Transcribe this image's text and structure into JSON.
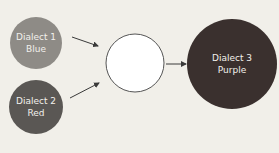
{
  "diagram": {
    "nodes": [
      {
        "id": "dialect1",
        "line1": "Dialect 1",
        "line2": "Blue",
        "fill": "#8e8b86"
      },
      {
        "id": "dialect2",
        "line1": "Dialect 2",
        "line2": "Red",
        "fill": "#5a5754"
      },
      {
        "id": "mix",
        "line1": "",
        "line2": "",
        "fill": "#ffffff"
      },
      {
        "id": "dialect3",
        "line1": "Dialect 3",
        "line2": "Purple",
        "fill": "#3a302e"
      }
    ],
    "edges": [
      {
        "from": "dialect1",
        "to": "mix"
      },
      {
        "from": "dialect2",
        "to": "mix"
      },
      {
        "from": "mix",
        "to": "dialect3"
      }
    ]
  }
}
